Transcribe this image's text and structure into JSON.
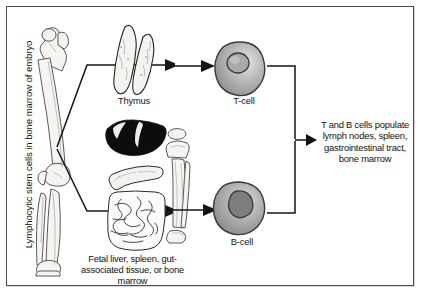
{
  "figure": {
    "type": "biology-flow-diagram",
    "topic": "Development of T and B lymphocytes"
  },
  "labels": {
    "source_axis": "Lymphocytic stem cells in bone marrow of embryo",
    "thymus": "Thymus",
    "t_cell": "T-cell",
    "b_cell": "B-cell",
    "bursa_equivalent": "Fetal liver, spleen, gut-\nassociated tissue, or bone\nmarrow",
    "outcome": "T and B cells populate\nlymph nodes, spleen,\ngastrointestinal tract,\nbone marrow"
  },
  "icons": {
    "femur": "femur-bone-icon",
    "tibia": "tibia-bone-icon",
    "thymus": "thymus-organ-icon",
    "liver": "liver-organ-icon",
    "spleen": "spleen-organ-icon",
    "intestine": "intestine-organ-icon",
    "t_cell": "t-lymphocyte-cell-icon",
    "b_cell": "b-lymphocyte-cell-icon",
    "arrow": "arrow-icon",
    "bracket": "bracket-icon"
  },
  "colors": {
    "ink": "#141414",
    "frame": "#4a4a4a",
    "liver_fill": "#0d0d0d",
    "bone_fill": "#f3f2ef",
    "cell_rim": "#5d5d5d",
    "background": "#ffffff"
  },
  "flow": {
    "nodes": [
      "bone-marrow",
      "thymus",
      "bursa-equivalent",
      "t-cell",
      "b-cell",
      "populate-tissues"
    ],
    "edges": [
      {
        "from": "bone-marrow",
        "to": "thymus"
      },
      {
        "from": "bone-marrow",
        "to": "bursa-equivalent"
      },
      {
        "from": "thymus",
        "to": "t-cell"
      },
      {
        "from": "bursa-equivalent",
        "to": "b-cell"
      },
      {
        "from": "t-cell",
        "to": "populate-tissues"
      },
      {
        "from": "b-cell",
        "to": "populate-tissues"
      }
    ]
  }
}
